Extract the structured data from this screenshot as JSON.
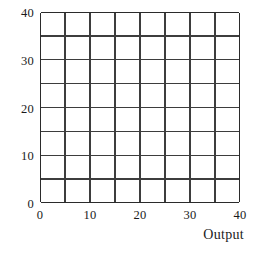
{
  "chart_data": {
    "type": "table",
    "title": "",
    "subtitle": "",
    "xlabel": "Output",
    "ylabel": "",
    "xlim": [
      0,
      40
    ],
    "ylim": [
      0,
      40
    ],
    "grid": true,
    "grid_step": 5,
    "legend": null,
    "series": [],
    "annotations": [],
    "x_ticks": [
      {
        "value": 0,
        "label": "0"
      },
      {
        "value": 10,
        "label": "10"
      },
      {
        "value": 20,
        "label": "20"
      },
      {
        "value": 30,
        "label": "30"
      },
      {
        "value": 40,
        "label": "40"
      }
    ],
    "y_ticks": [
      {
        "value": 0,
        "label": "0"
      },
      {
        "value": 10,
        "label": "10"
      },
      {
        "value": 20,
        "label": "20"
      },
      {
        "value": 30,
        "label": "30"
      },
      {
        "value": 40,
        "label": "40"
      }
    ],
    "colors": {
      "grid_line": "#3d3d3d",
      "axis_line": "#2b2b2b",
      "background": "#ffffff",
      "text": "#1a1a1a"
    }
  },
  "axes": {
    "x_title": "Output",
    "y_title": "",
    "x_tick_labels": [
      "0",
      "10",
      "20",
      "30",
      "40"
    ],
    "y_tick_labels": [
      "0",
      "10",
      "20",
      "30",
      "40"
    ]
  }
}
